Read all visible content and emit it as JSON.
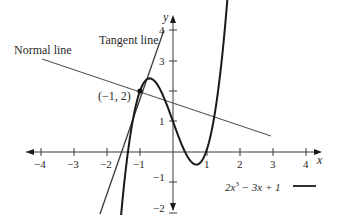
{
  "chart_data": {
    "type": "line",
    "title": "",
    "xlabel": "x",
    "ylabel": "y",
    "xlim": [
      -4.1,
      4.4
    ],
    "ylim": [
      -2.3,
      4.3
    ],
    "grid": false,
    "x_ticks": [
      -4,
      -3,
      -2,
      -1,
      1,
      2,
      3,
      4
    ],
    "x_tick_labels": [
      "−4",
      "−3",
      "−2",
      "−1",
      "1",
      "2",
      "3",
      "4"
    ],
    "y_ticks": [
      4,
      3,
      1,
      -1,
      -2
    ],
    "y_tick_labels": [
      "4",
      "3",
      "1",
      "−1",
      "−2"
    ],
    "series": [
      {
        "name": "2x^3 − 3x + 1",
        "kind": "curve",
        "equation": "y = 2x^3 - 3x + 1",
        "x_range": [
          -1.6,
          1.75
        ],
        "color": "#1a1a1a"
      },
      {
        "name": "Tangent line",
        "kind": "line",
        "equation": "y = 3x + 5",
        "x_range": [
          -2.3,
          -0.27
        ],
        "color": "#444444"
      },
      {
        "name": "Normal line",
        "kind": "line",
        "equation": "y = -x/3 + 5/3",
        "x_range": [
          -3.5,
          2.95
        ],
        "color": "#555555"
      }
    ],
    "point": {
      "x": -1,
      "y": 2,
      "label": "(−1, 2)"
    },
    "annotations": [
      {
        "text": "Normal line",
        "x": -3.6,
        "y": 3.5
      },
      {
        "text": "Tangent line",
        "x": -2.1,
        "y": 3.8
      }
    ],
    "legend": {
      "text": "2x³ − 3x + 1",
      "position": "bottom-right"
    }
  },
  "labels": {
    "normal_line": "Normal line",
    "tangent_line": "Tangent line",
    "point": "(−1, 2)",
    "x_axis": "x",
    "y_axis": "y",
    "legend_prefix": "2x",
    "legend_exp": "3",
    "legend_suffix": " − 3x + 1",
    "xt": [
      "−4",
      "−3",
      "−2",
      "−1",
      "1",
      "2",
      "3",
      "4"
    ],
    "yt": [
      "4",
      "3",
      "1",
      "−1",
      "−2"
    ]
  }
}
